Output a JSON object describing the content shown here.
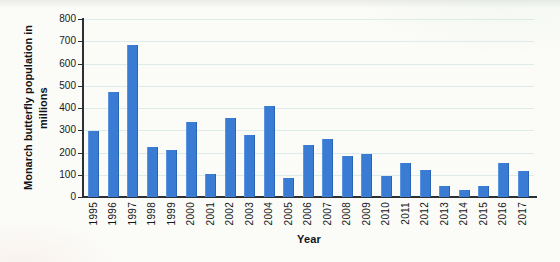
{
  "chart_data": {
    "type": "bar",
    "title": "",
    "xlabel": "Year",
    "ylabel": "Monarch butterfly population in millions",
    "ylabel_lines": [
      "Monarch butterfly population in",
      "millions"
    ],
    "categories": [
      "1995",
      "1996",
      "1997",
      "1998",
      "1999",
      "2000",
      "2001",
      "2002",
      "2003",
      "2004",
      "2005",
      "2006",
      "2007",
      "2008",
      "2009",
      "2010",
      "2011",
      "2012",
      "2013",
      "2014",
      "2015",
      "2016",
      "2017"
    ],
    "values": [
      295,
      470,
      685,
      225,
      210,
      335,
      105,
      355,
      280,
      410,
      85,
      235,
      260,
      185,
      195,
      95,
      155,
      120,
      50,
      30,
      50,
      155,
      115
    ],
    "ylim": [
      0,
      800
    ],
    "yticks": [
      0,
      100,
      200,
      300,
      400,
      500,
      600,
      700,
      800
    ],
    "grid": true,
    "legend": false,
    "bar_color": "#3a7cd3",
    "gridline_color": "#dcecea",
    "axis_color": "#2c3034",
    "text_color": "#14161a",
    "background_color": "#fbfbf7"
  }
}
